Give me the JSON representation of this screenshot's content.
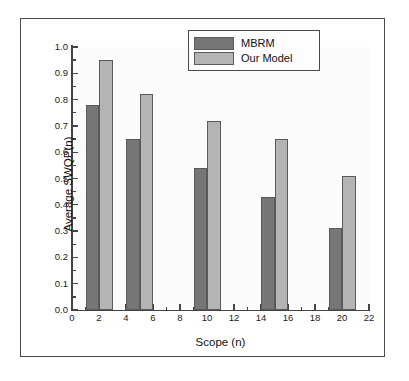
{
  "chart_data": {
    "type": "bar",
    "title": "",
    "xlabel": "Scope (n)",
    "ylabel": "Average SWQP(n)",
    "xlim": [
      0,
      22
    ],
    "ylim": [
      0.0,
      1.0
    ],
    "grid": false,
    "legend_position": "top-center",
    "x_ticks": [
      "0",
      "2",
      "4",
      "6",
      "8",
      "10",
      "12",
      "14",
      "16",
      "18",
      "20",
      "22"
    ],
    "x_tick_values": [
      0,
      2,
      4,
      6,
      8,
      10,
      12,
      14,
      16,
      18,
      20,
      22
    ],
    "y_ticks": [
      "0.0",
      "0.1",
      "0.2",
      "0.3",
      "0.4",
      "0.5",
      "0.6",
      "0.7",
      "0.8",
      "0.9",
      "1.0"
    ],
    "y_tick_values": [
      0.0,
      0.1,
      0.2,
      0.3,
      0.4,
      0.5,
      0.6,
      0.7,
      0.8,
      0.9,
      1.0
    ],
    "categories": [
      "2",
      "5",
      "10",
      "15",
      "20"
    ],
    "series": [
      {
        "name": "MBRM",
        "color": "#767676",
        "values": [
          0.78,
          0.65,
          0.54,
          0.43,
          0.31
        ],
        "bar_spans": [
          [
            1,
            2
          ],
          [
            4,
            5
          ],
          [
            9,
            10
          ],
          [
            14,
            15
          ],
          [
            19,
            20
          ]
        ]
      },
      {
        "name": "Our Model",
        "color": "#b4b4b4",
        "values": [
          0.95,
          0.82,
          0.72,
          0.65,
          0.51
        ],
        "bar_spans": [
          [
            2,
            3
          ],
          [
            5,
            6
          ],
          [
            10,
            11
          ],
          [
            15,
            16
          ],
          [
            20,
            21
          ]
        ]
      }
    ]
  },
  "legend": {
    "items": [
      {
        "label": "MBRM",
        "color": "#767676"
      },
      {
        "label": "Our Model",
        "color": "#b4b4b4"
      }
    ]
  },
  "colors": {
    "mbrm": "#767676",
    "our_model": "#b4b4b4",
    "axis": "#444444",
    "frame": "#4a4a4a",
    "plot_background": "#fbfbfb"
  }
}
